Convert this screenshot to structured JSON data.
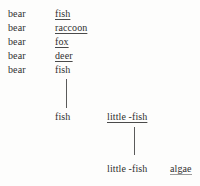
{
  "figure": {
    "type": "tree-diagram",
    "rows": [
      {
        "subject": "bear",
        "object": "fish",
        "object_underlined": true
      },
      {
        "subject": "bear",
        "object": "raccoon",
        "object_underlined": true
      },
      {
        "subject": "bear",
        "object": "fox",
        "object_underlined": true
      },
      {
        "subject": "bear",
        "object": "deer",
        "object_underlined": true
      },
      {
        "subject": "bear",
        "object": "fish",
        "object_underlined": false
      }
    ],
    "level2": {
      "left": "fish",
      "left_underlined": false,
      "right": "little -fish",
      "right_underlined": true
    },
    "level3": {
      "left": "little -fish",
      "left_underlined": false,
      "right": "algae",
      "right_underlined": true
    },
    "connectors": [
      {
        "name": "fish-to-fish"
      },
      {
        "name": "little-fish-to-little-fish"
      }
    ],
    "colors": {
      "background": "#fdfdfc",
      "text": "#2f2f2f",
      "rule": "#5a5a5a"
    }
  }
}
